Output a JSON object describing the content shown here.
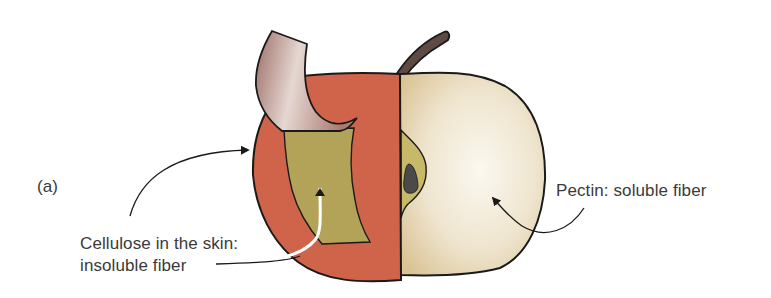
{
  "figure": {
    "panel_label": "(a)",
    "annotations": [
      {
        "id": "cellulose",
        "lines": [
          "Cellulose in the skin:",
          "insoluble fiber"
        ],
        "points_to": [
          "apple skin (red)",
          "skin flesh patch (olive)"
        ]
      },
      {
        "id": "pectin",
        "lines": [
          "Pectin:  soluble fiber"
        ],
        "points_to": [
          "apple flesh (cream)"
        ]
      }
    ],
    "colors": {
      "skin_red": "#d0644a",
      "peel_flap": "#b58a80",
      "inner_olive": "#b3a358",
      "flesh_cream": "#efe5cf",
      "stem_brown": "#5e4a42",
      "seed_dark": "#4a4a48",
      "outline": "#1a1a1a",
      "text": "#3a3a3a"
    }
  }
}
